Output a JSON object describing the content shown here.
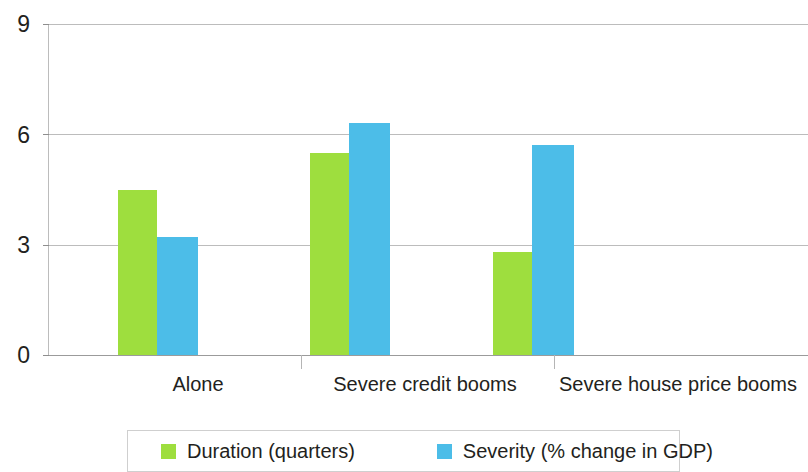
{
  "chart_data": {
    "type": "bar",
    "title": "",
    "subtitle": "",
    "xlabel": "",
    "ylabel": "",
    "categories": [
      "Alone",
      "Severe credit booms",
      "Severe house price booms"
    ],
    "series": [
      {
        "name": "Duration (quarters)",
        "color": "#9ede3e",
        "values": [
          4.5,
          5.5,
          2.8
        ]
      },
      {
        "name": "Severity (% change in GDP)",
        "color": "#4cbde8",
        "values": [
          3.2,
          6.3,
          5.7
        ]
      }
    ],
    "ylim": [
      0,
      9
    ],
    "yticks": [
      0,
      3,
      6,
      9
    ],
    "ytick_labels": [
      "0",
      "3",
      "6",
      "9"
    ],
    "grid": true,
    "legend_position": "bottom"
  },
  "axis": {
    "y_tick_0": "0",
    "y_tick_1": "3",
    "y_tick_2": "6",
    "y_tick_3": "9"
  },
  "categories": {
    "c0": "Alone",
    "c1": "Severe credit booms",
    "c2": "Severe house price booms"
  },
  "legend": {
    "entry_0": "Duration (quarters)",
    "entry_1": "Severity (% change in GDP)"
  }
}
